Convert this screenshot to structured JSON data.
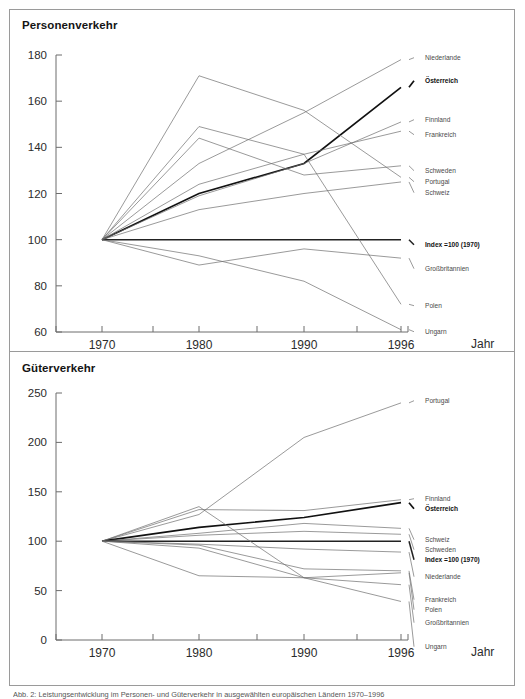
{
  "document": {
    "caption": "Abb. 2: Leistungsentwicklung im Personen- und Güterverkehr in ausgewählten europäischen Ländern 1970–1996"
  },
  "colors": {
    "frame": "#9a9a9a",
    "axis": "#6d6d6d",
    "line": "#6e6e6e",
    "emphasis": "#111111",
    "text": "#2b2b2b"
  },
  "panels": [
    {
      "id": "personenverkehr",
      "title": "Personenverkehr",
      "axis_name": "Jahr"
    },
    {
      "id": "gueterverkehr",
      "title": "Güterverkehr",
      "axis_name": "Jahr"
    }
  ],
  "chart_data": [
    {
      "type": "line",
      "title": "Personenverkehr",
      "xlabel": "Jahr",
      "ylabel": "",
      "x": [
        1970,
        1980,
        1990,
        1996
      ],
      "xticks": [
        "1970",
        "1980",
        "1990",
        "1996"
      ],
      "yticks": [
        60,
        80,
        100,
        120,
        140,
        160,
        180
      ],
      "ylim": [
        60,
        180
      ],
      "grid": false,
      "legend": "right-endpoint-labels",
      "series": [
        {
          "name": "Niederlande",
          "values": [
            100,
            133,
            155,
            178
          ],
          "emphasis": false
        },
        {
          "name": "Österreich",
          "values": [
            100,
            120,
            133,
            166
          ],
          "emphasis": true
        },
        {
          "name": "Finnland",
          "values": [
            100,
            119,
            133,
            151
          ],
          "emphasis": false
        },
        {
          "name": "Frankreich",
          "values": [
            100,
            124,
            137,
            147
          ],
          "emphasis": false
        },
        {
          "name": "Schweden",
          "values": [
            100,
            144,
            128,
            132
          ],
          "emphasis": false
        },
        {
          "name": "Portugal",
          "values": [
            100,
            171,
            156,
            127
          ],
          "emphasis": false
        },
        {
          "name": "Schweiz",
          "values": [
            100,
            113,
            120,
            125
          ],
          "emphasis": false
        },
        {
          "name": "Index =100 (1970)",
          "values": [
            100,
            100,
            100,
            100
          ],
          "emphasis": true,
          "baseline": true
        },
        {
          "name": "Großbritannien",
          "values": [
            100,
            89,
            96,
            92
          ],
          "emphasis": false
        },
        {
          "name": "Polen",
          "values": [
            100,
            149,
            137,
            72
          ],
          "emphasis": false
        },
        {
          "name": "Ungarn",
          "values": [
            100,
            93,
            82,
            61
          ],
          "emphasis": false
        }
      ]
    },
    {
      "type": "line",
      "title": "Güterverkehr",
      "xlabel": "Jahr",
      "ylabel": "",
      "x": [
        1970,
        1980,
        1990,
        1996
      ],
      "xticks": [
        "1970",
        "1980",
        "1990",
        "1996"
      ],
      "yticks": [
        0,
        50,
        100,
        150,
        200,
        250
      ],
      "ylim": [
        0,
        250
      ],
      "grid": false,
      "legend": "right-endpoint-labels",
      "series": [
        {
          "name": "Portugal",
          "values": [
            100,
            127,
            205,
            240
          ],
          "emphasis": false
        },
        {
          "name": "Finnland",
          "values": [
            100,
            132,
            131,
            142
          ],
          "emphasis": false
        },
        {
          "name": "Österreich",
          "values": [
            100,
            114,
            124,
            139
          ],
          "emphasis": true
        },
        {
          "name": "Schweiz",
          "values": [
            100,
            108,
            118,
            113
          ],
          "emphasis": false
        },
        {
          "name": "Schweden",
          "values": [
            100,
            106,
            110,
            107
          ],
          "emphasis": false
        },
        {
          "name": "Index =100 (1970)",
          "values": [
            100,
            100,
            100,
            100
          ],
          "emphasis": true,
          "baseline": true
        },
        {
          "name": "Niederlande",
          "values": [
            100,
            97,
            92,
            89
          ],
          "emphasis": false
        },
        {
          "name": "Frankreich",
          "values": [
            100,
            96,
            72,
            70
          ],
          "emphasis": false
        },
        {
          "name": "Polen",
          "values": [
            100,
            135,
            63,
            68
          ],
          "emphasis": false
        },
        {
          "name": "Großbritannien",
          "values": [
            100,
            65,
            63,
            56
          ],
          "emphasis": false
        },
        {
          "name": "Ungarn",
          "values": [
            100,
            93,
            63,
            39
          ],
          "emphasis": false
        }
      ]
    }
  ]
}
